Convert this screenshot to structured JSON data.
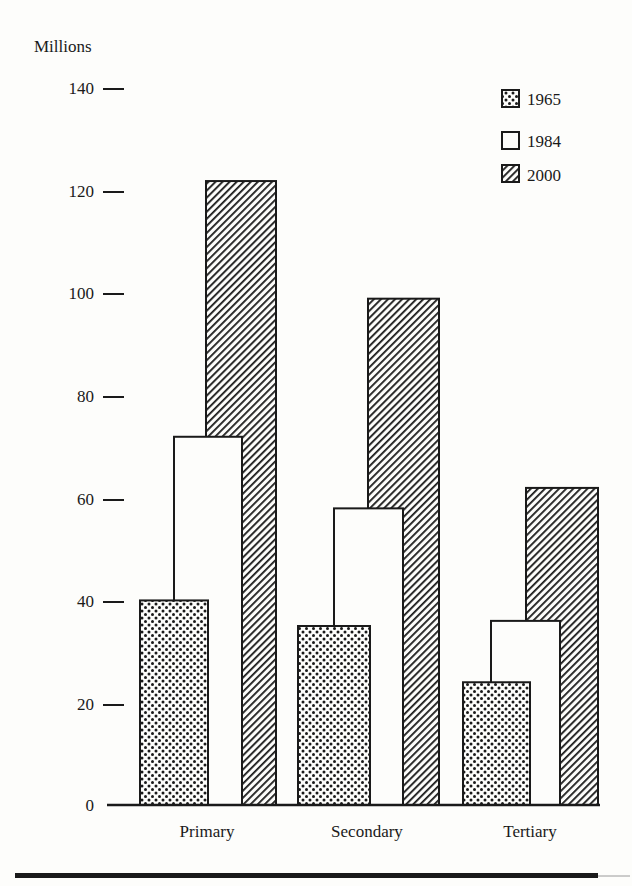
{
  "chart_data": {
    "type": "bar",
    "title": "",
    "xlabel": "",
    "ylabel": "Millions",
    "ylim": [
      0,
      140
    ],
    "yticks": [
      0,
      20,
      40,
      60,
      80,
      100,
      120,
      140
    ],
    "grid": false,
    "legend_position": "top-right",
    "categories": [
      "Primary",
      "Secondary",
      "Tertiary"
    ],
    "series": [
      {
        "name": "1965",
        "pattern": "dots",
        "values": [
          40,
          35,
          24
        ]
      },
      {
        "name": "1984",
        "pattern": "empty",
        "values": [
          72,
          58,
          36
        ]
      },
      {
        "name": "2000",
        "pattern": "diagonal-hatch",
        "values": [
          122,
          99,
          62
        ]
      }
    ]
  },
  "axis": {
    "y_label": "Millions",
    "ticks": [
      "0",
      "20",
      "40",
      "60",
      "80",
      "100",
      "120",
      "140"
    ]
  },
  "legend": {
    "items": [
      "1965",
      "1984",
      "2000"
    ]
  },
  "colors": {
    "ink": "#1a1a1a",
    "paper": "#fdfdfb"
  }
}
